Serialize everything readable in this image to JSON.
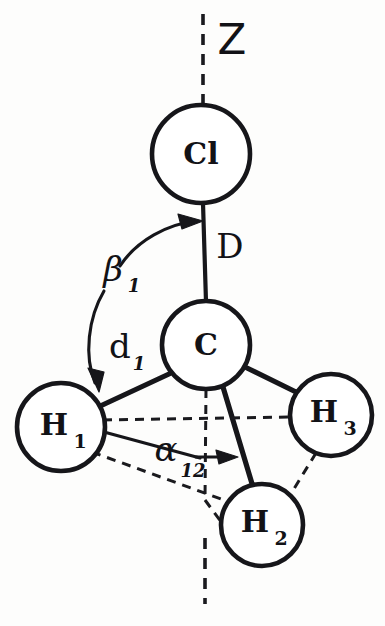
{
  "figure": {
    "kind": "molecular-geometry-diagram",
    "molecule": "CH3Cl",
    "background_color": "#fdfdfc",
    "ink_color": "#16161a",
    "caption": ""
  },
  "axis": {
    "label": "Z",
    "orientation": "vertical",
    "style": "dashed"
  },
  "atoms": [
    {
      "id": "cl",
      "label": "Cl",
      "subscript": "",
      "cx": 201,
      "cy": 154,
      "r": 49
    },
    {
      "id": "c",
      "label": "C",
      "subscript": "",
      "cx": 206,
      "cy": 345,
      "r": 44
    },
    {
      "id": "h1",
      "label": "H",
      "subscript": "1",
      "cx": 61,
      "cy": 427,
      "r": 44
    },
    {
      "id": "h2",
      "label": "H",
      "subscript": "2",
      "cx": 262,
      "cy": 525,
      "r": 41
    },
    {
      "id": "h3",
      "label": "H",
      "subscript": "3",
      "cx": 331,
      "cy": 415,
      "r": 41
    }
  ],
  "bonds": [
    {
      "id": "c-cl",
      "from": "c",
      "to": "cl",
      "style": "solid"
    },
    {
      "id": "c-h1",
      "from": "c",
      "to": "h1",
      "style": "solid"
    },
    {
      "id": "c-h2",
      "from": "c",
      "to": "h2",
      "style": "solid"
    },
    {
      "id": "c-h3",
      "from": "c",
      "to": "h3",
      "style": "solid"
    }
  ],
  "dashed_edges": [
    {
      "id": "h1-h3",
      "from": "h1",
      "to": "h3"
    },
    {
      "id": "h1-h2",
      "from": "h1",
      "to": "h2"
    },
    {
      "id": "h3-h2",
      "from": "h3",
      "to": "h2"
    },
    {
      "id": "c-down-axis",
      "from": "c",
      "to": "axis-bottom"
    }
  ],
  "measures": {
    "bond_length_cl": {
      "label": "D",
      "subscript": "",
      "description": "C to Cl distance"
    },
    "bond_length_h1": {
      "label": "d",
      "subscript": "1",
      "description": "C to H1 distance"
    },
    "angle_beta": {
      "label": "β",
      "subscript": "1",
      "description": "angle between Z axis / C-Cl bond and C-H1 bond"
    },
    "angle_alpha": {
      "label": "α",
      "subscript": "12",
      "description": "azimuthal angle between H1 and H2 about the Z axis"
    }
  }
}
